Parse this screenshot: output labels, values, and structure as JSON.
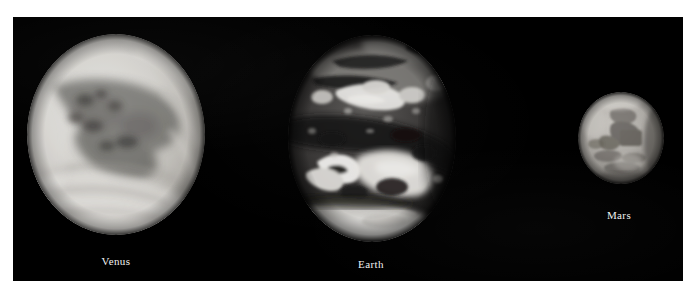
{
  "figure": {
    "background_color": "#ffffff",
    "plate_color": "#000000",
    "label_color": "#f2f2f2",
    "caption_font_style": "serif"
  },
  "planets": [
    {
      "name": "Venus",
      "label": "Venus",
      "appearance": "bright pale cloud-covered disc with swirling banded cloud patterns",
      "relative_size": "large",
      "brightness": "bright light gray",
      "disc": {
        "left": 27,
        "top": 34,
        "diameter": 178
      },
      "label_position": {
        "left": 56,
        "top": 255
      }
    },
    {
      "name": "Earth",
      "label": "Earth",
      "appearance": "high contrast dark oceans and landmasses with bright white cloud swirls and bright south polar cap",
      "relative_size": "large",
      "brightness": "high contrast dark with white highlights",
      "disc": {
        "left": 288,
        "top": 35,
        "diameter": 168
      },
      "label_position": {
        "left": 311,
        "top": 258
      }
    },
    {
      "name": "Mars",
      "label": "Mars",
      "appearance": "small medium gray disc with darker surface albedo markings",
      "relative_size": "small",
      "brightness": "medium gray",
      "disc": {
        "left": 578,
        "top": 92,
        "diameter": 88
      },
      "label_position": {
        "left": 559,
        "top": 209
      }
    }
  ]
}
